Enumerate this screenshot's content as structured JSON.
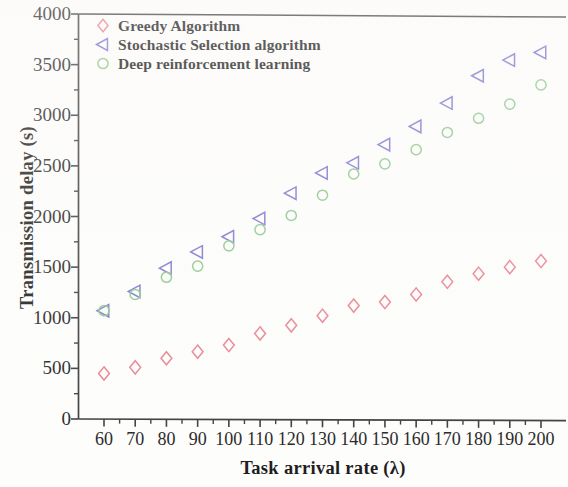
{
  "chart_data": {
    "type": "scatter",
    "title": "",
    "xlabel": "Task arrival rate (λ)",
    "ylabel": "Transmission delay (s)",
    "x": [
      60,
      70,
      80,
      90,
      100,
      110,
      120,
      130,
      140,
      150,
      160,
      170,
      180,
      190,
      200
    ],
    "xlim": [
      55,
      205
    ],
    "ylim": [
      0,
      4000
    ],
    "xticks": [
      60,
      70,
      80,
      90,
      100,
      110,
      120,
      130,
      140,
      150,
      160,
      170,
      180,
      190,
      200
    ],
    "yticks": [
      0,
      500,
      1000,
      1500,
      2000,
      2500,
      3000,
      3500,
      4000
    ],
    "xtick_labels": [
      "60",
      "70",
      "80",
      "90",
      "100",
      "110",
      "120",
      "130",
      "140",
      "150",
      "160",
      "170",
      "180",
      "190",
      "200"
    ],
    "ytick_labels": [
      "0",
      "500",
      "1000",
      "1500",
      "2000",
      "2500",
      "3000",
      "3500",
      "4000"
    ],
    "minor_ticks": true,
    "grid": false,
    "legend_position": "upper-left",
    "series": [
      {
        "name": "Greedy Algorithm",
        "marker": "diamond",
        "color": "#e8818f",
        "values": [
          450,
          510,
          600,
          665,
          730,
          845,
          925,
          1020,
          1120,
          1155,
          1230,
          1355,
          1435,
          1500,
          1560
        ]
      },
      {
        "name": "Stochastic Selection algorithm",
        "marker": "triangle-left",
        "color": "#7b74cf",
        "values": [
          1070,
          1260,
          1490,
          1650,
          1800,
          1980,
          2230,
          2430,
          2530,
          2710,
          2890,
          3120,
          3390,
          3545,
          3620
        ]
      },
      {
        "name": "Deep reinforcement learning",
        "marker": "circle",
        "color": "#8cc78c",
        "values": [
          1070,
          1230,
          1400,
          1510,
          1710,
          1870,
          2010,
          2210,
          2420,
          2520,
          2660,
          2830,
          2970,
          3110,
          3300
        ]
      }
    ]
  },
  "axis": {
    "x_title": "Task arrival rate (λ)",
    "y_title": "Transmission delay (s)"
  },
  "legend": {
    "entries": [
      {
        "label": "Greedy Algorithm",
        "marker": "diamond-icon",
        "color": "#e8818f"
      },
      {
        "label": "Stochastic Selection algorithm",
        "marker": "triangle-left-icon",
        "color": "#7b74cf"
      },
      {
        "label": "Deep reinforcement learning",
        "marker": "circle-icon",
        "color": "#8cc78c"
      }
    ]
  }
}
